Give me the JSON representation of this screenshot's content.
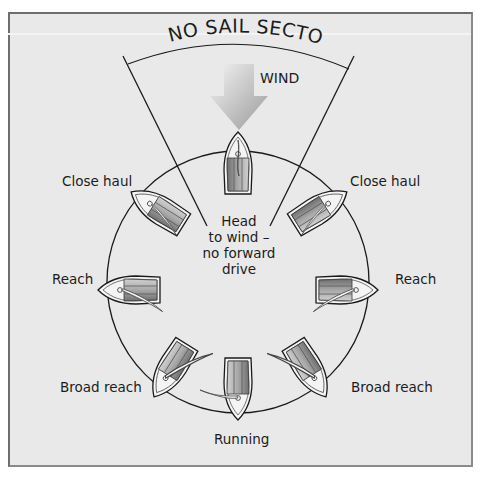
{
  "diagram": {
    "title": "NO SAIL SECTOR",
    "wind_label": "WIND",
    "center_text": [
      "Head",
      "to wind –",
      "no forward",
      "drive"
    ],
    "points_of_sail": {
      "close_haul_left": "Close haul",
      "close_haul_right": "Close haul",
      "reach_left": "Reach",
      "reach_right": "Reach",
      "broad_reach_left": "Broad reach",
      "broad_reach_right": "Broad reach",
      "running": "Running"
    },
    "icons": {
      "wind_arrow": "wind-arrow-icon",
      "boat": "sailboat-icon"
    },
    "colors": {
      "background": "#e9e9e9",
      "frame": "#6e6e6e",
      "line": "#1a1a1a",
      "hull_dark": "#7a7a7a",
      "hull_light": "#c8c8c8",
      "sail": "#f2f2f2"
    }
  }
}
